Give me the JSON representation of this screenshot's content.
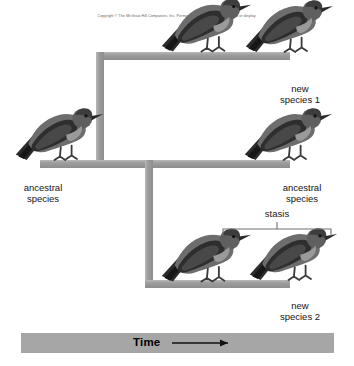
{
  "figure": {
    "copyright": "Copyright © The McGraw-Hill Companies, Inc. Permission required for reproduction or display.",
    "colors": {
      "branch_gray": "#9a9a9a",
      "branch_gray_light": "#b3b3b3",
      "time_bar_gray": "#a6a6a6",
      "bracket_gray": "#6e6e6e",
      "text_black": "#141414",
      "background": "#ffffff"
    },
    "labels": {
      "new_species_1_line1": "new",
      "new_species_1_line2": "species 1",
      "ancestral_left_line1": "ancestral",
      "ancestral_left_line2": "species",
      "ancestral_right_line1": "ancestral",
      "ancestral_right_line2": "species",
      "stasis": "stasis",
      "new_species_2_line1": "new",
      "new_species_2_line2": "species 2",
      "time": "Time"
    },
    "birds": [
      {
        "name": "bird-ancestral-left",
        "label": "ancestral species"
      },
      {
        "name": "bird-top-branch",
        "label": "unlabeled perched bird on upper branch"
      },
      {
        "name": "bird-new-species-1",
        "label": "new species 1"
      },
      {
        "name": "bird-ancestral-right",
        "label": "ancestral species"
      },
      {
        "name": "bird-stasis-left",
        "label": "stasis bird left"
      },
      {
        "name": "bird-new-species-2",
        "label": "new species 2"
      }
    ],
    "time_arrow": "⟶"
  }
}
